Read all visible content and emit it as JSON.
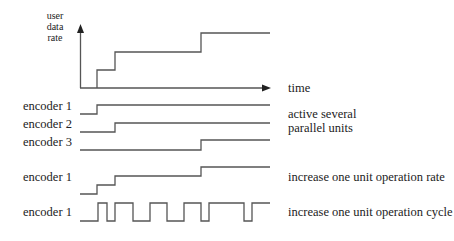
{
  "diagram": {
    "colors": {
      "line": "#555555",
      "text": "#222222",
      "background": "#ffffff"
    },
    "axis": {
      "y_label_lines": [
        "user",
        "data",
        "rate"
      ],
      "x_label": "time"
    },
    "rate_plot": {
      "description": "user data rate step function over time",
      "steps": [
        {
          "x_start": 97,
          "level": 1
        },
        {
          "x_start": 115,
          "level": 2
        },
        {
          "x_start": 201,
          "level": 3
        }
      ]
    },
    "signals": [
      {
        "label": "encoder 1",
        "group": "parallel",
        "rise_at": 97
      },
      {
        "label": "encoder 2",
        "group": "parallel",
        "rise_at": 115
      },
      {
        "label": "encoder 3",
        "group": "parallel",
        "rise_at": 201
      },
      {
        "label": "encoder 1",
        "group": "rate",
        "steps_at": [
          97,
          115,
          201
        ]
      },
      {
        "label": "encoder 1",
        "group": "cycle",
        "pulse_edges": [
          98,
          107,
          115,
          133,
          150,
          167,
          184,
          201,
          209,
          244,
          252
        ]
      }
    ],
    "descriptions": {
      "parallel_line1": "active several",
      "parallel_line2": "parallel units",
      "rate": "increase one unit operation rate",
      "cycle": "increase one unit operation cycle"
    }
  }
}
